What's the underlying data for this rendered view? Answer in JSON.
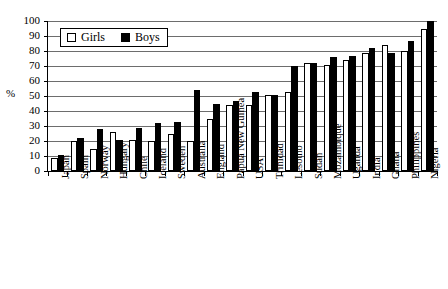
{
  "chart_data": {
    "type": "bar",
    "title": "",
    "xlabel": "",
    "ylabel": "%",
    "ylim": [
      0,
      100
    ],
    "yticks": [
      0,
      10,
      20,
      30,
      40,
      50,
      60,
      70,
      80,
      90,
      100
    ],
    "grid": true,
    "legend_position": "top-left",
    "categories": [
      "Japan",
      "Spain",
      "Norway",
      "Hungary",
      "Chile",
      "Iceland",
      "Sweden",
      "Australia",
      "England",
      "Papua New Guinea",
      "USA",
      "Trinidad",
      "Lesotho",
      "Sudan",
      "Mozambique",
      "Uganda",
      "India",
      "Ghana",
      "Philippines",
      "Nigeria"
    ],
    "series": [
      {
        "name": "Girls",
        "color": "#ffffff",
        "values": [
          9,
          20,
          15,
          26,
          21,
          20,
          25,
          20,
          35,
          44,
          44,
          51,
          53,
          72,
          71,
          74,
          79,
          84,
          80,
          95
        ]
      },
      {
        "name": "Boys",
        "color": "#000000",
        "values": [
          11,
          22,
          28,
          21,
          29,
          32,
          33,
          54,
          45,
          47,
          53,
          51,
          70,
          72,
          76,
          77,
          82,
          79,
          87,
          100
        ]
      }
    ]
  },
  "legend": {
    "girls_label": "Girls",
    "boys_label": "Boys"
  },
  "axes": {
    "y_title": "%"
  }
}
